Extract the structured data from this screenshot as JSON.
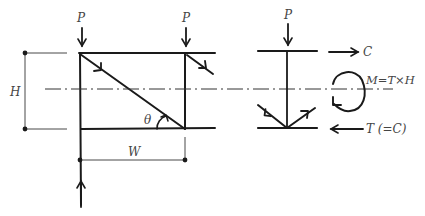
{
  "diagram": {
    "type": "structural free-body diagram",
    "left_frame": {
      "loads": [
        {
          "label": "P",
          "position": "top-left",
          "direction": "down"
        },
        {
          "label": "P",
          "position": "top-right",
          "direction": "down"
        }
      ],
      "reaction": {
        "position": "bottom-left",
        "direction": "up"
      },
      "dimensions": {
        "height_label": "H",
        "width_label": "W"
      },
      "angle_label": "θ"
    },
    "right_section": {
      "load": {
        "label": "P",
        "direction": "down"
      },
      "forces": {
        "top": "C",
        "bottom": "T (=C)",
        "moment": "M=T×H"
      }
    }
  },
  "colors": {
    "ink": "#1a1a1a",
    "label": "#444444",
    "background": "#ffffff"
  }
}
